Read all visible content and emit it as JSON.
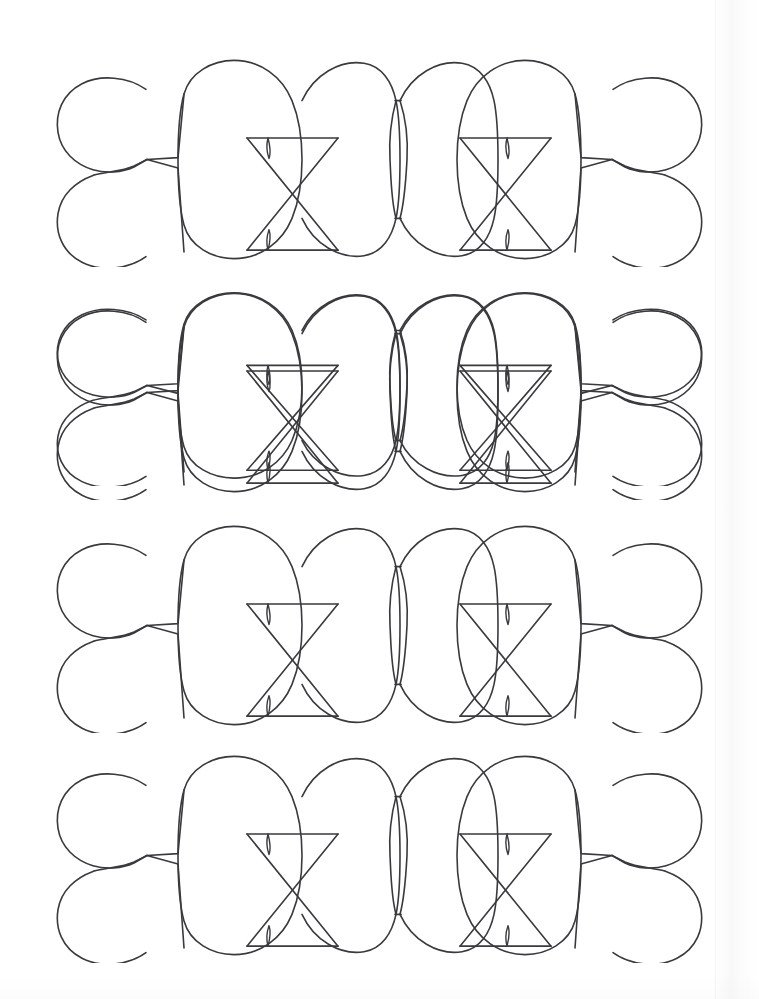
{
  "document": {
    "title": "Decorative Band Pattern Template (Scanned Line Art)",
    "page_background": "#ffffff",
    "ink_color": "#3a3a3e",
    "width_px": 759,
    "height_px": 999,
    "stroke_width_px": 1.6,
    "visible_text": "",
    "artifact_note": "faint vertical scan fold near right edge"
  },
  "artwork": {
    "kind": "line-art-outline-pattern",
    "row_count": 4,
    "row_label": "pattern-band",
    "rows": [
      {
        "index": 1,
        "top_px": 52,
        "height_px": 215
      },
      {
        "index": 2,
        "top_px": 285,
        "height_px": 215
      },
      {
        "index": 3,
        "top_px": 518,
        "height_px": 215
      },
      {
        "index": 4,
        "top_px": 748,
        "height_px": 215
      }
    ],
    "motif": {
      "name": "clover-oval-bowtie band",
      "elements": [
        {
          "name": "left-clover-pair",
          "description": "two rounded lobes joined by a Y stem"
        },
        {
          "name": "large-oval-1",
          "description": "tall rounded oval"
        },
        {
          "name": "bowtie-crossing-1",
          "description": "X crossing with top and bottom horizontal bars"
        },
        {
          "name": "bowtie-spindle-top-1",
          "description": "small vertical leaf hanging below top bar"
        },
        {
          "name": "bowtie-spindle-bottom-1",
          "description": "small vertical leaf rising above bottom bar"
        },
        {
          "name": "large-oval-2",
          "description": "tall rounded oval"
        },
        {
          "name": "center-lens-pinch",
          "description": "narrow vertical lens where two ovals meet"
        },
        {
          "name": "large-oval-3",
          "description": "tall rounded oval"
        },
        {
          "name": "bowtie-crossing-2",
          "description": "X crossing with top and bottom horizontal bars"
        },
        {
          "name": "bowtie-spindle-top-2",
          "description": "small vertical leaf hanging below top bar"
        },
        {
          "name": "bowtie-spindle-bottom-2",
          "description": "small vertical leaf rising above bottom bar"
        },
        {
          "name": "large-oval-4",
          "description": "tall rounded oval"
        },
        {
          "name": "right-clover-pair",
          "description": "mirrored two rounded lobes joined by a Y stem"
        }
      ]
    }
  }
}
